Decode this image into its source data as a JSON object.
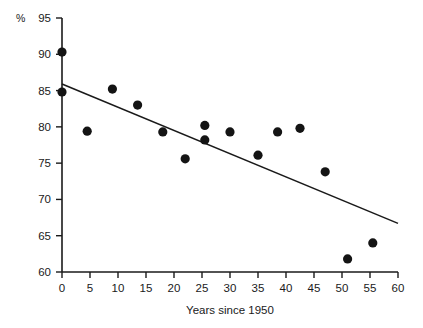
{
  "chart_data": {
    "type": "scatter",
    "title": "",
    "subtitle": "",
    "xlabel": "Years since 1950",
    "ylabel": "%",
    "unit_label": "%",
    "xlim": [
      0,
      60
    ],
    "ylim": [
      60,
      95
    ],
    "xticks": [
      0,
      5,
      10,
      15,
      20,
      25,
      30,
      35,
      40,
      45,
      50,
      55,
      60
    ],
    "yticks": [
      60,
      65,
      70,
      75,
      80,
      85,
      90,
      95
    ],
    "xtick_labels": [
      "0",
      "5",
      "10",
      "15",
      "20",
      "25",
      "30",
      "35",
      "40",
      "45",
      "50",
      "55",
      "60"
    ],
    "ytick_labels": [
      "60",
      "65",
      "70",
      "75",
      "80",
      "85",
      "90",
      "95"
    ],
    "grid": false,
    "legend": null,
    "legend_position": "none",
    "point_color": "#141414",
    "line_color": "#1a1a1a",
    "axis_color": "#1a1a1a",
    "background_color": "#ffffff",
    "series": [
      {
        "name": "observations",
        "marker": "filled-circle",
        "points": [
          {
            "x": 0.0,
            "y": 90.3
          },
          {
            "x": 0.0,
            "y": 84.8
          },
          {
            "x": 4.5,
            "y": 79.4
          },
          {
            "x": 9.0,
            "y": 85.2
          },
          {
            "x": 13.5,
            "y": 83.0
          },
          {
            "x": 18.0,
            "y": 79.3
          },
          {
            "x": 22.0,
            "y": 75.6
          },
          {
            "x": 25.5,
            "y": 80.2
          },
          {
            "x": 25.5,
            "y": 78.2
          },
          {
            "x": 30.0,
            "y": 79.3
          },
          {
            "x": 35.0,
            "y": 76.1
          },
          {
            "x": 38.5,
            "y": 79.3
          },
          {
            "x": 42.5,
            "y": 79.8
          },
          {
            "x": 47.0,
            "y": 73.8
          },
          {
            "x": 51.0,
            "y": 61.8
          },
          {
            "x": 55.5,
            "y": 64.0
          }
        ]
      }
    ],
    "trend_line": {
      "name": "least-squares fit",
      "x_start": 0,
      "y_start": 85.9,
      "x_end": 60,
      "y_end": 66.7,
      "slope": -0.32,
      "intercept": 85.9
    }
  }
}
